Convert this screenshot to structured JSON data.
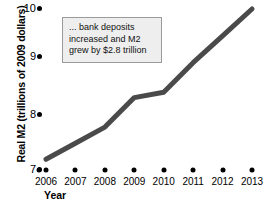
{
  "chart_data": {
    "type": "line",
    "title": "",
    "subtitle": "",
    "xlabel": "Year",
    "ylabel": "Real M2 (trillions of 2009 dollars)",
    "categories": [
      "2006",
      "2007",
      "2008",
      "2009",
      "2010",
      "2011",
      "2012",
      "2013"
    ],
    "series": [
      {
        "name": "Real M2",
        "values": [
          7.2,
          7.5,
          7.8,
          8.35,
          8.45,
          9.0,
          9.5,
          10.0
        ]
      }
    ],
    "xlim": [
      2006,
      2013
    ],
    "ylim": [
      7,
      10
    ],
    "y_ticks": [
      7,
      8,
      9,
      10
    ],
    "x_ticks": [
      "2006",
      "2007",
      "2008",
      "2009",
      "2010",
      "2011",
      "2012",
      "2013"
    ],
    "grid": false,
    "legend": "none",
    "line_color": "#4a4a4a",
    "line_width": 5,
    "marker_color": "#000000",
    "annotations": [
      {
        "name": "bank-deposits-callout",
        "lines": [
          "... bank deposits",
          "increased and M2",
          "grew by $2.8 trillion"
        ],
        "background": "#eeeeee",
        "border_color": "#9a9a9a"
      }
    ]
  },
  "axes": {
    "y_title": "Real M2 (trillions of 2009 dollars)",
    "x_title": "Year",
    "y_tick_labels": [
      "10",
      "9",
      "8",
      "7"
    ],
    "x_tick_labels": [
      "2006",
      "2007",
      "2008",
      "2009",
      "2010",
      "2011",
      "2012",
      "2013"
    ]
  },
  "callout": {
    "line1": "... bank deposits",
    "line2": "increased and M2",
    "line3": "grew by $2.8 trillion"
  }
}
